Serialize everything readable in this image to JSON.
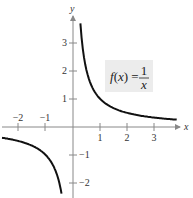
{
  "chart_data": {
    "type": "line",
    "title": "",
    "function": "f(x) = 1/x",
    "xlabel": "x",
    "ylabel": "y",
    "xlim": [
      -2.6,
      3.8
    ],
    "ylim": [
      -2.6,
      3.9
    ],
    "grid": false,
    "x_ticks": [
      -2,
      -1,
      1,
      2,
      3
    ],
    "y_ticks": [
      -2,
      -1,
      1,
      2,
      3
    ],
    "x_tick_labels": [
      "−2",
      "−1",
      "1",
      "2",
      "3"
    ],
    "y_tick_labels": [
      "−2",
      "−1",
      "1",
      "2",
      "3"
    ],
    "annotation": {
      "text": "f(x) = 1/x",
      "numerator": "1",
      "denominator": "x",
      "lhs": "f(x) ="
    },
    "series": [
      {
        "name": "f(x) = 1/x (x > 0)",
        "x": [
          0.27,
          0.3,
          0.4,
          0.5,
          0.75,
          1,
          1.5,
          2,
          2.5,
          3,
          3.5,
          3.8
        ],
        "values": [
          3.7,
          3.33,
          2.5,
          2.0,
          1.33,
          1.0,
          0.67,
          0.5,
          0.4,
          0.33,
          0.29,
          0.26
        ]
      },
      {
        "name": "f(x) = 1/x (x < 0)",
        "x": [
          -2.6,
          -2.5,
          -2,
          -1.5,
          -1,
          -0.75,
          -0.6,
          -0.5,
          -0.42
        ],
        "values": [
          -0.38,
          -0.4,
          -0.5,
          -0.67,
          -1.0,
          -1.33,
          -1.67,
          -2.0,
          -2.4
        ]
      }
    ],
    "colors": {
      "curve": "#111111",
      "axes": "#888888",
      "label_box": "#ececec"
    }
  }
}
